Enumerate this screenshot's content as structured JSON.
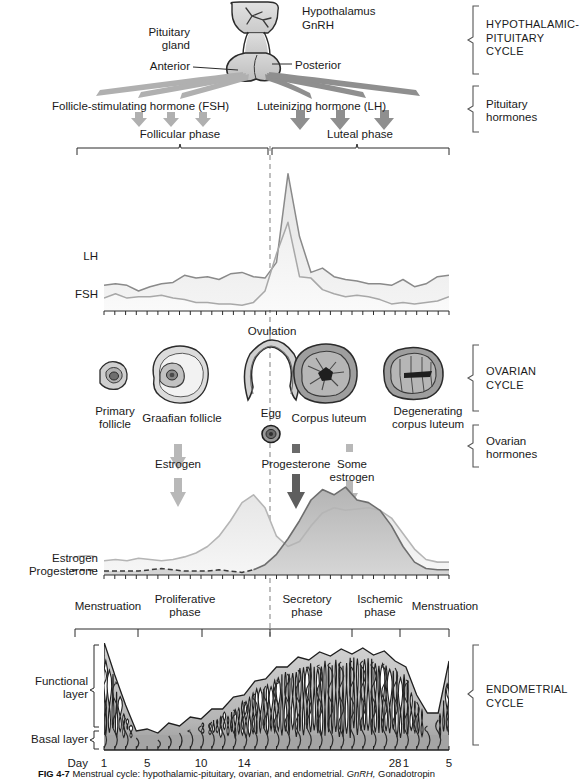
{
  "figure": {
    "caption_id": "FIG 4-7",
    "caption_text": "Menstrual cycle: hypothalamic-pituitary, ovarian, and endometrial.",
    "caption_abbr": "GnRH,",
    "caption_tail": "Gonadotropin"
  },
  "anatomy": {
    "hypothalamus": "Hypothalamus",
    "gnrh": "GnRH",
    "pituitary_gland": "Pituitary\ngland",
    "anterior": "Anterior",
    "posterior": "Posterior"
  },
  "pituitary_hormones": {
    "fsh": "Follicle-stimulating hormone (FSH)",
    "lh": "Luteinizing hormone (LH)",
    "follicular_phase": "Follicular phase",
    "luteal_phase": "Luteal phase"
  },
  "side_brackets": [
    {
      "id": "hypothalamic-pituitary-cycle",
      "label": "HYPOTHALAMIC-\nPITUITARY\nCYCLE",
      "style": "caps"
    },
    {
      "id": "pituitary-hormones",
      "label": "Pituitary\nhormones",
      "style": "normal"
    },
    {
      "id": "ovarian-cycle",
      "label": "OVARIAN\nCYCLE",
      "style": "caps"
    },
    {
      "id": "ovarian-hormones",
      "label": "Ovarian\nhormones",
      "style": "normal"
    },
    {
      "id": "endometrial-cycle",
      "label": "ENDOMETRIAL\nCYCLE",
      "style": "caps"
    }
  ],
  "gonadotropin_chart": {
    "series": [
      {
        "name": "LH",
        "label": "LH",
        "color": "#8a8a8a",
        "fill": "#e8e8e8"
      },
      {
        "name": "FSH",
        "label": "FSH",
        "color": "#a8a8a8",
        "fill": "#f2f2f2"
      }
    ],
    "lh_values": [
      18,
      19,
      18,
      14,
      17,
      19,
      20,
      25,
      23,
      24,
      22,
      26,
      27,
      24,
      23,
      34,
      96,
      52,
      27,
      30,
      24,
      22,
      21,
      19,
      19,
      18,
      22,
      17,
      19,
      24,
      25
    ],
    "fsh_values": [
      9,
      12,
      9,
      10,
      10,
      11,
      9,
      8,
      6,
      6,
      5,
      5,
      4,
      6,
      14,
      40,
      62,
      24,
      23,
      15,
      12,
      10,
      11,
      10,
      8,
      5,
      6,
      5,
      6,
      7,
      10
    ],
    "peak_day": 14,
    "xlim": [
      1,
      33
    ],
    "ylim": [
      0,
      100
    ]
  },
  "ovarian_cycle": {
    "ovulation": "Ovulation",
    "structures": [
      {
        "id": "primary-follicle",
        "label": "Primary\nfollicle"
      },
      {
        "id": "graafian-follicle",
        "label": "Graafian follicle"
      },
      {
        "id": "egg",
        "label": "Egg"
      },
      {
        "id": "corpus-luteum",
        "label": "Corpus luteum"
      },
      {
        "id": "degenerating-corpus-luteum",
        "label": "Degenerating\ncorpus luteum"
      }
    ]
  },
  "ovarian_hormone_arrows": [
    {
      "id": "estrogen-arrow",
      "label": "Estrogen",
      "tone": "light"
    },
    {
      "id": "progesterone-arrow",
      "label": "Progesterone",
      "tone": "dark"
    },
    {
      "id": "some-estrogen-arrow",
      "label": "Some\nestrogen",
      "tone": "light"
    }
  ],
  "steroid_chart": {
    "series": [
      {
        "name": "Estrogen",
        "label": "Estrogen",
        "color": "#b5b5b5",
        "fill": "#ebebeb"
      },
      {
        "name": "Progesterone",
        "label": "Progesterone",
        "color": "#6e6e6e",
        "fill": "#bcbcbc"
      }
    ],
    "estrogen_values": [
      11,
      12,
      11,
      13,
      12,
      11,
      12,
      14,
      17,
      22,
      30,
      42,
      56,
      62,
      52,
      30,
      22,
      26,
      38,
      48,
      52,
      50,
      51,
      52,
      50,
      44,
      32,
      20,
      12,
      10,
      10
    ],
    "progesterone_values": [
      3,
      3,
      3,
      3,
      4,
      5,
      4,
      3,
      3,
      3,
      4,
      3,
      2,
      4,
      8,
      16,
      28,
      42,
      58,
      66,
      62,
      68,
      58,
      56,
      50,
      38,
      22,
      10,
      5,
      4,
      4
    ],
    "xlim": [
      1,
      33
    ],
    "ylim": [
      0,
      75
    ]
  },
  "endometrial_cycle": {
    "phases": [
      {
        "id": "menstruation-1",
        "label": "Menstruation"
      },
      {
        "id": "proliferative-phase",
        "label": "Proliferative\nphase"
      },
      {
        "id": "secretory-phase",
        "label": "Secretory\nphase"
      },
      {
        "id": "ischemic-phase",
        "label": "Ischemic\nphase"
      },
      {
        "id": "menstruation-2",
        "label": "Menstruation"
      }
    ],
    "layers": [
      {
        "id": "functional-layer",
        "label": "Functional\nlayer"
      },
      {
        "id": "basal-layer",
        "label": "Basal layer"
      }
    ]
  },
  "day_axis": {
    "title": "Day",
    "ticks": [
      {
        "value": "1",
        "day": 1
      },
      {
        "value": "5",
        "day": 5
      },
      {
        "value": "10",
        "day": 10
      },
      {
        "value": "14",
        "day": 14
      },
      {
        "value": "28",
        "day": 28
      },
      {
        "value": "1",
        "day": 29
      },
      {
        "value": "5",
        "day": 33
      }
    ]
  }
}
